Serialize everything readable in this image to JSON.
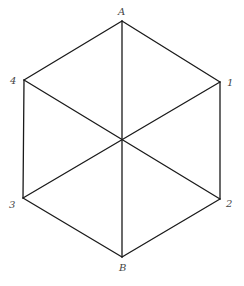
{
  "diagram": {
    "type": "hexagon-with-diagonals",
    "vertices": {
      "A": {
        "label": "A",
        "x": 122,
        "y": 21
      },
      "1": {
        "label": "1",
        "x": 220,
        "y": 82
      },
      "2": {
        "label": "2",
        "x": 220,
        "y": 199
      },
      "B": {
        "label": "B",
        "x": 122,
        "y": 257
      },
      "3": {
        "label": "3",
        "x": 23,
        "y": 198
      },
      "4": {
        "label": "4",
        "x": 24,
        "y": 80
      },
      "center": {
        "x": 122,
        "y": 143
      }
    },
    "edges": [
      [
        "A",
        "1"
      ],
      [
        "1",
        "2"
      ],
      [
        "2",
        "B"
      ],
      [
        "B",
        "3"
      ],
      [
        "3",
        "4"
      ],
      [
        "4",
        "A"
      ],
      [
        "A",
        "center"
      ],
      [
        "center",
        "B"
      ],
      [
        "4",
        "center"
      ],
      [
        "center",
        "2"
      ],
      [
        "1",
        "center"
      ],
      [
        "center",
        "3"
      ]
    ],
    "labels": {
      "A": "A",
      "B": "B",
      "one": "1",
      "two": "2",
      "three": "3",
      "four": "4"
    }
  }
}
